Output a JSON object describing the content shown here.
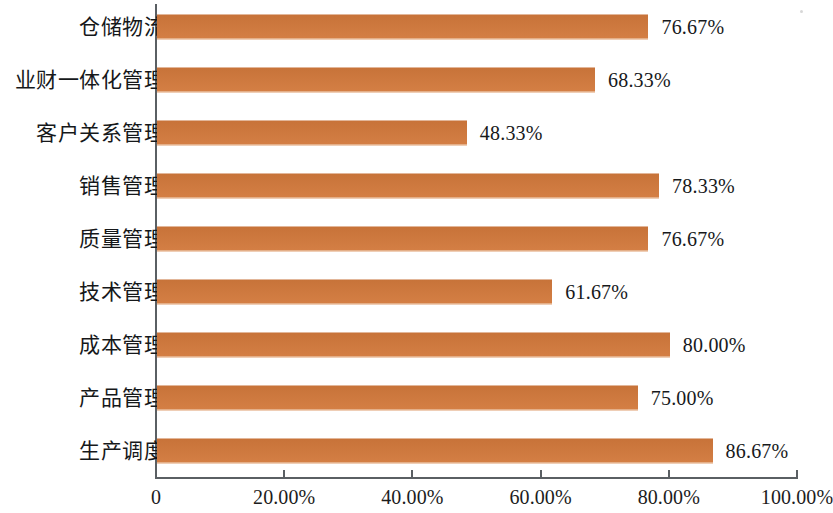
{
  "chart_data": {
    "type": "bar",
    "orientation": "horizontal",
    "title": "",
    "subtitle": "",
    "xlabel": "",
    "ylabel": "",
    "grid": false,
    "legend": null,
    "xlim": [
      0,
      100
    ],
    "axis_ticks": [
      "0",
      "20.00%",
      "40.00%",
      "60.00%",
      "80.00%",
      "100.00%"
    ],
    "axis_tick_values": [
      0,
      20,
      40,
      60,
      80,
      100
    ],
    "categories": [
      "仓储物流",
      "业财一体化管理",
      "客户关系管理",
      "销售管理",
      "质量管理",
      "技术管理",
      "成本管理",
      "产品管理",
      "生产调度"
    ],
    "values": [
      76.67,
      68.33,
      48.33,
      78.33,
      76.67,
      61.67,
      80.0,
      75.0,
      86.67
    ],
    "value_labels": [
      "76.67%",
      "68.33%",
      "48.33%",
      "78.33%",
      "76.67%",
      "61.67%",
      "80.00%",
      "75.00%",
      "86.67%"
    ],
    "series": [
      {
        "name": "",
        "values": [
          76.67,
          68.33,
          48.33,
          78.33,
          76.67,
          61.67,
          80.0,
          75.0,
          86.67
        ]
      }
    ],
    "bar_color": "#d2793c",
    "axis_color": "#5a5f63",
    "text_color": "#17191b",
    "background_color": "#ffffff"
  }
}
